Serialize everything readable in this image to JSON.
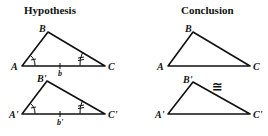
{
  "titles": {
    "hypothesis": "Hypothesis",
    "conclusion": "Conclusion"
  },
  "hypothesis": {
    "triangle_1": {
      "vertices": {
        "A": "A",
        "B": "B",
        "C": "C"
      },
      "side_label": "b",
      "marks": {
        "angle_A": "single-tick-arc",
        "angle_C": "double-tick-arc",
        "side_AC": "single-tick"
      }
    },
    "triangle_2": {
      "vertices": {
        "A": "A'",
        "B": "B'",
        "C": "C'"
      },
      "side_label": "b'",
      "marks": {
        "angle_A": "single-tick-arc",
        "angle_C": "double-tick-arc",
        "side_AC": "single-tick"
      }
    }
  },
  "conclusion": {
    "triangle_1": {
      "vertices": {
        "A": "A",
        "B": "B",
        "C": "C"
      }
    },
    "triangle_2": {
      "vertices": {
        "A": "A'",
        "B": "B'",
        "C": "C'"
      }
    },
    "relation_symbol": "≅"
  },
  "colors": {
    "ink": "#111111",
    "background": "#ffffff"
  }
}
